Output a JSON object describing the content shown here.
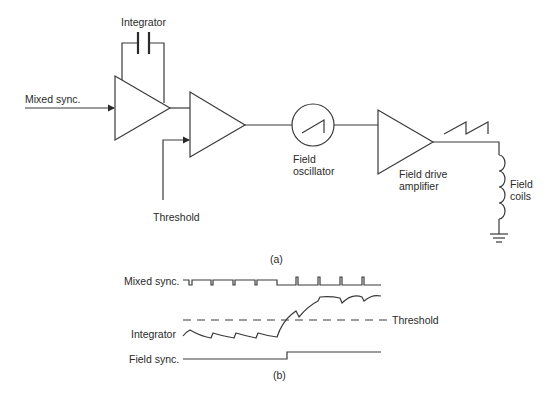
{
  "diagram": {
    "part_a": {
      "caption": "(a)",
      "blocks": {
        "integrator_label": "Integrator",
        "input_label": "Mixed sync.",
        "threshold_label": "Threshold",
        "oscillator_label": "Field\noscillator",
        "amplifier_label": "Field drive\namplifier",
        "coils_label": "Field\ncoils"
      },
      "components": [
        "capacitor",
        "integrator-amplifier",
        "comparator-amplifier",
        "field-oscillator-sawtooth",
        "field-drive-amplifier",
        "inductor-coils",
        "ground"
      ],
      "connections": [
        {
          "from": "Mixed sync.",
          "to": "integrator-amplifier"
        },
        {
          "from": "integrator-amplifier",
          "to": "comparator-amplifier"
        },
        {
          "from": "Threshold",
          "to": "comparator-amplifier"
        },
        {
          "from": "comparator-amplifier",
          "to": "field-oscillator-sawtooth"
        },
        {
          "from": "field-oscillator-sawtooth",
          "to": "field-drive-amplifier"
        },
        {
          "from": "field-drive-amplifier",
          "to": "inductor-coils"
        },
        {
          "from": "inductor-coils",
          "to": "ground"
        }
      ]
    },
    "part_b": {
      "caption": "(b)",
      "waveforms": {
        "mixed_sync_label": "Mixed sync.",
        "integrator_label": "Integrator",
        "threshold_label": "Threshold",
        "field_sync_label": "Field sync."
      }
    }
  }
}
